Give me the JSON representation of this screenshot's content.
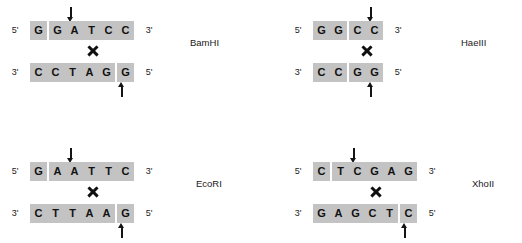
{
  "figure": {
    "highlight_color": "#c3c3c3",
    "text_color": "#111111",
    "background": "#ffffff"
  },
  "panels": [
    {
      "id": "bamhi",
      "name": "BamHI",
      "top_strand": {
        "left_end": "5'",
        "right_end": "3'",
        "blocks": [
          [
            "G"
          ],
          [
            "G",
            "A",
            "T",
            "C",
            "C"
          ]
        ]
      },
      "bottom_strand": {
        "left_end": "3'",
        "right_end": "5'",
        "blocks": [
          [
            "C",
            "C",
            "T",
            "A",
            "G"
          ],
          [
            "G"
          ]
        ]
      },
      "cut_top_after_base": 1,
      "cut_bottom_after_base": 5,
      "cut_type": "sticky-5-overhang",
      "scissors": "X"
    },
    {
      "id": "haeiii",
      "name": "HaeIII",
      "top_strand": {
        "left_end": "5'",
        "right_end": "3'",
        "blocks": [
          [
            "G",
            "G"
          ],
          [
            "C",
            "C"
          ]
        ]
      },
      "bottom_strand": {
        "left_end": "3'",
        "right_end": "5'",
        "blocks": [
          [
            "C",
            "C"
          ],
          [
            "G",
            "G"
          ]
        ]
      },
      "cut_top_after_base": 2,
      "cut_bottom_after_base": 2,
      "cut_type": "blunt",
      "scissors": "X"
    },
    {
      "id": "ecori",
      "name": "EcoRI",
      "top_strand": {
        "left_end": "5'",
        "right_end": "3'",
        "blocks": [
          [
            "G"
          ],
          [
            "A",
            "A",
            "T",
            "T",
            "C"
          ]
        ]
      },
      "bottom_strand": {
        "left_end": "3'",
        "right_end": "5'",
        "blocks": [
          [
            "C",
            "T",
            "T",
            "A",
            "A"
          ],
          [
            "G"
          ]
        ]
      },
      "cut_top_after_base": 1,
      "cut_bottom_after_base": 5,
      "cut_type": "sticky-5-overhang",
      "scissors": "X"
    },
    {
      "id": "xhoii",
      "name": "XhoII",
      "top_strand": {
        "left_end": "5'",
        "right_end": "3'",
        "blocks": [
          [
            "C"
          ],
          [
            "T",
            "C",
            "G",
            "A",
            "G"
          ]
        ]
      },
      "bottom_strand": {
        "left_end": "3'",
        "right_end": "5'",
        "blocks": [
          [
            "G",
            "A",
            "G",
            "C",
            "T"
          ],
          [
            "C"
          ]
        ]
      },
      "cut_top_after_base": 1,
      "cut_bottom_after_base": 5,
      "cut_type": "sticky-5-overhang",
      "scissors": "X"
    }
  ]
}
